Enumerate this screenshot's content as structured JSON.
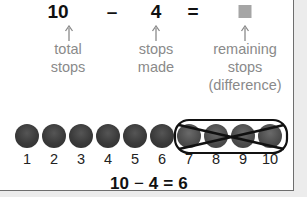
{
  "equation_top": {
    "total": "10",
    "minus": "–",
    "made": "4",
    "equals": "=",
    "unknown": "unknown-box"
  },
  "captions": {
    "total": [
      "total",
      "stops"
    ],
    "made": [
      "stops",
      "made"
    ],
    "remaining": [
      "remaining",
      "stops",
      "(difference)"
    ]
  },
  "stops": {
    "labels": [
      "1",
      "2",
      "3",
      "4",
      "5",
      "6",
      "7",
      "8",
      "9",
      "10"
    ],
    "crossed_out": [
      "7",
      "8",
      "9",
      "10"
    ]
  },
  "equation_bottom": {
    "total": "10",
    "minus": "−",
    "made": "4",
    "equals": "=",
    "result": "6"
  },
  "colors": {
    "dot": "#3a3a3a",
    "caption": "#8a8a8a",
    "unknown_box": "#a5a5a5",
    "border": "#6e6e6e"
  }
}
